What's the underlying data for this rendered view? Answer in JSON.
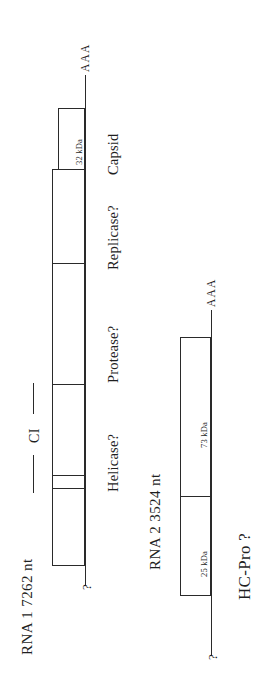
{
  "figure": {
    "orientation": "rotated-90-ccw",
    "line_color": "#2a2a2a",
    "background_color": "#ffffff"
  },
  "rna1": {
    "name": "RNA 1 7262 nt",
    "five_prime_label": "?",
    "three_prime_label": "AAA",
    "ci_label": "CI",
    "products": [
      {
        "name": "Helicase?",
        "size": ""
      },
      {
        "name": "Protease?",
        "size": ""
      },
      {
        "name": "Replicase?",
        "size": ""
      },
      {
        "name": "Capsid",
        "size": "32 kDa"
      }
    ]
  },
  "rna2": {
    "name": "RNA 2 3524 nt",
    "five_prime_label": "?",
    "three_prime_label": "AAA",
    "function_label": "HC-Pro ?",
    "products": [
      {
        "name": "",
        "size": "25 kDa"
      },
      {
        "name": "",
        "size": "73 kDa"
      }
    ]
  }
}
